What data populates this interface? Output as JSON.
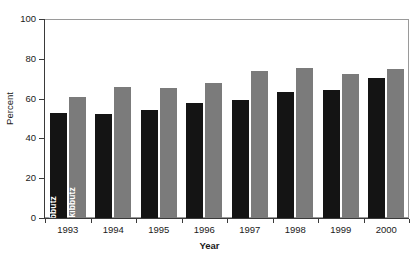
{
  "chart_data": {
    "type": "bar",
    "title": "",
    "subtitle": "",
    "xlabel": "Year",
    "ylabel": "Percent",
    "categories": [
      "1993",
      "1994",
      "1995",
      "1996",
      "1997",
      "1998",
      "1999",
      "2000"
    ],
    "series": [
      {
        "name": "Kibbutz",
        "color": "#141414",
        "values": [
          53,
          52.5,
          54.5,
          58,
          59.5,
          63.5,
          64.5,
          70.5
        ]
      },
      {
        "name": "Non kibbutz",
        "color": "#7b7b7b",
        "values": [
          61,
          66,
          65.5,
          68,
          74,
          75.5,
          72.5,
          75
        ]
      }
    ],
    "ylim": [
      0,
      100
    ],
    "yticks": [
      0,
      20,
      40,
      60,
      80,
      100
    ],
    "ytick_labels": [
      "0",
      "20",
      "40",
      "60",
      "80",
      "100"
    ],
    "grid": false,
    "legend": "in-bar-labels",
    "annotations": [
      {
        "text": "Kibbutz",
        "inside_bar": "1993-kibbutz",
        "orientation": "vertical"
      },
      {
        "text": "Non kibbutz",
        "inside_bar": "1993-nonkibbutz",
        "orientation": "vertical"
      }
    ]
  },
  "axes": {
    "y_title": "Percent",
    "x_title": "Year",
    "y_ticks": [
      {
        "label": "100",
        "value": 100
      },
      {
        "label": "80",
        "value": 80
      },
      {
        "label": "60",
        "value": 60
      },
      {
        "label": "40",
        "value": 40
      },
      {
        "label": "20",
        "value": 20
      },
      {
        "label": "0",
        "value": 0
      }
    ],
    "x_ticks": [
      {
        "label": "1993"
      },
      {
        "label": "1994"
      },
      {
        "label": "1995"
      },
      {
        "label": "1996"
      },
      {
        "label": "1997"
      },
      {
        "label": "1998"
      },
      {
        "label": "1999"
      },
      {
        "label": "2000"
      }
    ]
  },
  "style": {
    "kibbutz_color": "#141414",
    "nonkibbutz_color": "#7b7b7b",
    "frame_color": "#9a9a9a",
    "axis_color": "#3a3a3a",
    "background": "#ffffff"
  }
}
